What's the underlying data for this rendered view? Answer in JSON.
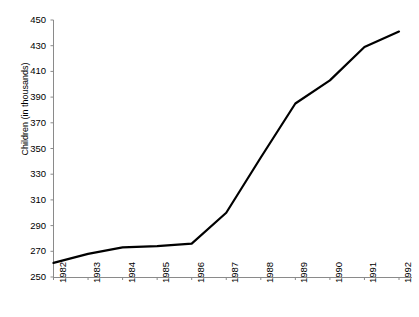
{
  "chart_data": {
    "type": "line",
    "title": "",
    "subtitle": "",
    "xlabel": "",
    "ylabel": "Children (in thousands)",
    "categories": [
      "1982",
      "1983",
      "1984",
      "1985",
      "1986",
      "1987",
      "1988",
      "1989",
      "1990",
      "1991",
      "1992"
    ],
    "values": [
      261,
      268,
      273,
      274,
      276,
      300,
      343,
      385,
      403,
      429,
      441
    ],
    "series": [
      {
        "name": "Children (in thousands)",
        "values": [
          261,
          268,
          273,
          274,
          276,
          300,
          343,
          385,
          403,
          429,
          441
        ]
      }
    ],
    "ylim": [
      250,
      450
    ],
    "ytick_step": 20,
    "yticks": [
      250,
      270,
      290,
      310,
      330,
      350,
      370,
      390,
      410,
      430,
      450
    ],
    "xlim": [
      "1982",
      "1992"
    ],
    "grid": false,
    "legend": false,
    "legend_position": "none",
    "line_color": "#000000",
    "line_width": 2.2,
    "axis_color": "#8a8a8a",
    "background_color": "#ffffff",
    "markers": false,
    "xtick_rotation": -90
  },
  "axes": {
    "y_title": "Children (in thousands)",
    "y_tick_labels": [
      "450",
      "430",
      "410",
      "390",
      "370",
      "350",
      "330",
      "310",
      "290",
      "270",
      "250"
    ],
    "x_tick_labels": [
      "1982",
      "1983",
      "1984",
      "1985",
      "1986",
      "1987",
      "1988",
      "1989",
      "1990",
      "1991",
      "1992"
    ]
  }
}
